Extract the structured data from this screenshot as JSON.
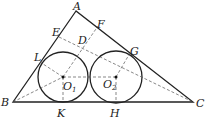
{
  "diagram": {
    "type": "geometry",
    "points": {
      "A": {
        "label": "A",
        "x": 76,
        "y": 11
      },
      "B": {
        "label": "B",
        "x": 13,
        "y": 102
      },
      "C": {
        "label": "C",
        "x": 193,
        "y": 102
      },
      "E": {
        "label": "E",
        "x": 59,
        "y": 35
      },
      "F": {
        "label": "F",
        "x": 98,
        "y": 24
      },
      "D": {
        "label": "D",
        "x": 84,
        "y": 42
      },
      "L": {
        "label": "L",
        "x": 40,
        "y": 60
      },
      "G": {
        "label": "G",
        "x": 130,
        "y": 51
      },
      "K": {
        "label": "K",
        "x": 63,
        "y": 102
      },
      "H": {
        "label": "H",
        "x": 116,
        "y": 102
      },
      "O1": {
        "label": "O",
        "sub": "1",
        "x": 63,
        "y": 77
      },
      "O2": {
        "label": "O",
        "sub": "2",
        "x": 116,
        "y": 77
      }
    },
    "circles": [
      {
        "center": "O1",
        "r": 25
      },
      {
        "center": "O2",
        "r": 26
      }
    ],
    "labels": {
      "A": "A",
      "B": "B",
      "C": "C",
      "D": "D",
      "E": "E",
      "F": "F",
      "G": "G",
      "H": "H",
      "K": "K",
      "L": "L",
      "O": "O",
      "one": "1",
      "two": "2"
    }
  }
}
